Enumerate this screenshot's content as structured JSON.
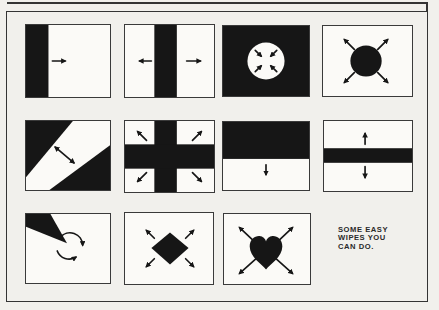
{
  "colors": {
    "paper": "#f1f0ec",
    "panel": "#fbfaf7",
    "ink": "#161616",
    "frame": "#343434"
  },
  "caption": {
    "lines": [
      "SOME EASY",
      "WIPES YOU",
      "CAN DO."
    ]
  },
  "panels": [
    {
      "name": "bar-wipe-right"
    },
    {
      "name": "bar-split-wipe"
    },
    {
      "name": "circle-iris-in"
    },
    {
      "name": "circle-iris-out"
    },
    {
      "name": "diagonal-band-wipe"
    },
    {
      "name": "cross-expand-wipe"
    },
    {
      "name": "half-wipe-down"
    },
    {
      "name": "band-expand-vertical"
    },
    {
      "name": "clock-wipe"
    },
    {
      "name": "diamond-expand-wipe"
    },
    {
      "name": "heart-expand-wipe"
    }
  ]
}
